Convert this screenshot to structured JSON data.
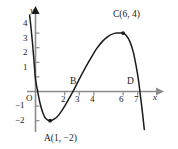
{
  "figure": {
    "kind": "cartesian-graph",
    "width": 178,
    "height": 149,
    "background": "#ffffff",
    "curve_color": "#1a1a1a",
    "axis_color": "#8c8c8c",
    "text_color": "#1a1a1a"
  },
  "axes": {
    "x_axis_label": "x",
    "y_axis_label": "y",
    "origin_label": "O",
    "x_ticks": [
      {
        "value": 2,
        "label": "2"
      },
      {
        "value": 3,
        "label": "3"
      },
      {
        "value": 4,
        "label": "4"
      },
      {
        "value": 6,
        "label": "6"
      },
      {
        "value": 7,
        "label": "7"
      }
    ],
    "y_ticks": [
      {
        "value": 4,
        "label": "4"
      },
      {
        "value": 3,
        "label": "3"
      },
      {
        "value": 2,
        "label": "2"
      },
      {
        "value": 1,
        "label": "1"
      },
      {
        "value": -1,
        "label": "−1"
      },
      {
        "value": -2,
        "label": "−2"
      }
    ],
    "x_range": [
      -0.45,
      7.9
    ],
    "y_range": [
      -3.0,
      4.6
    ],
    "grid": false,
    "arrows": [
      "x-positive",
      "y-positive"
    ]
  },
  "points": [
    {
      "name": "A",
      "label": "A(1, −2)",
      "x": 1,
      "y": -2,
      "marker": true,
      "label_pos": "below"
    },
    {
      "name": "B",
      "label": "B",
      "x": 3,
      "y": 0,
      "marker": false,
      "label_pos": "above-left"
    },
    {
      "name": "C",
      "label": "C(6, 4)",
      "x": 6,
      "y": 4,
      "marker": true,
      "label_pos": "above-right"
    },
    {
      "name": "D",
      "label": "D",
      "x": 7,
      "y": 0,
      "marker": false,
      "label_pos": "above-left"
    }
  ],
  "chart_data": {
    "type": "line",
    "title": "",
    "xlabel": "x",
    "ylabel": "y",
    "xlim": [
      -0.45,
      7.9
    ],
    "ylim": [
      -3.0,
      4.6
    ],
    "grid": false,
    "series": [
      {
        "name": "cubic-like curve",
        "x": [
          -0.4,
          -0.3,
          -0.2,
          -0.1,
          0.0,
          0.15,
          0.3,
          0.5,
          0.7,
          1.0,
          1.3,
          1.6,
          2.0,
          2.4,
          2.7,
          3.0,
          3.4,
          3.8,
          4.2,
          4.6,
          5.0,
          5.4,
          5.7,
          6.0,
          6.2,
          6.45,
          6.7,
          6.9,
          7.05,
          7.2,
          7.35,
          7.45
        ],
        "y": [
          5.2,
          4.3,
          3.25,
          2.05,
          0.85,
          0.0,
          -0.75,
          -1.45,
          -1.85,
          -2.0,
          -1.88,
          -1.6,
          -1.0,
          -0.3,
          0.25,
          0.85,
          1.6,
          2.3,
          2.95,
          3.45,
          3.8,
          3.98,
          4.0,
          4.0,
          3.85,
          3.45,
          2.7,
          1.7,
          0.8,
          -0.4,
          -1.65,
          -2.6
        ]
      }
    ],
    "annotations": [
      {
        "text": "A(1, −2)",
        "x": 1,
        "y": -2
      },
      {
        "text": "B",
        "x": 3,
        "y": 0
      },
      {
        "text": "C(6, 4)",
        "x": 6,
        "y": 4
      },
      {
        "text": "D",
        "x": 7,
        "y": 0
      }
    ]
  }
}
